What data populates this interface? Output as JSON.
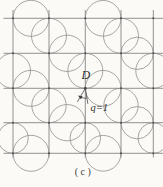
{
  "figure": {
    "type": "geometry-diagram",
    "caption": "(c)",
    "point_label": "D",
    "annotation_label": "q=1",
    "grid": {
      "vertical_lines": 5,
      "horizontal_lines": 5,
      "cells": "4x4"
    },
    "circle_count": 20,
    "colors": {
      "background": "#fbfaf7",
      "grid_line": "#6f6f6f",
      "circle_arc": "#8a8a8a",
      "vertex_dot": "#4d4d4d",
      "annotation": "#3a3a3a",
      "text": "#2e2e2e"
    }
  }
}
